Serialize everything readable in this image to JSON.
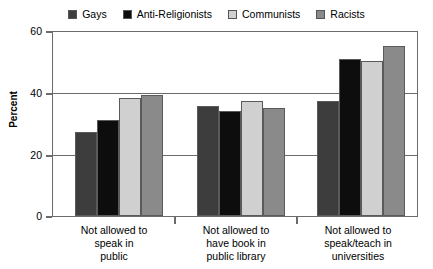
{
  "chart_data": {
    "type": "bar",
    "title": "",
    "subtitle": "",
    "xlabel": "",
    "ylabel": "Percent",
    "ylim": [
      0,
      60
    ],
    "yticks": [
      0,
      20,
      40,
      60
    ],
    "grid": true,
    "legend_position": "top-center",
    "categories": [
      "Not allowed to speak in public",
      "Not allowed to have book in public library",
      "Not allowed to speak/teach in universities"
    ],
    "category_lines": [
      [
        "Not allowed to",
        "speak in",
        "public"
      ],
      [
        "Not allowed to",
        "have book in",
        "public library"
      ],
      [
        "Not allowed to",
        "speak/teach in",
        "universities"
      ]
    ],
    "series": [
      {
        "name": "Gays",
        "color": "#3d3d3d",
        "values": [
          27,
          35.5,
          37
        ]
      },
      {
        "name": "Anti-Religionists",
        "color": "#0d0d0d",
        "values": [
          31,
          34,
          50.5
        ]
      },
      {
        "name": "Communists",
        "color": "#d0d0d0",
        "values": [
          38,
          37,
          50
        ]
      },
      {
        "name": "Racists",
        "color": "#8a8a8a",
        "values": [
          39,
          35,
          55
        ]
      }
    ]
  },
  "axis": {
    "y_tick_labels": [
      "60",
      "40",
      "20",
      "0"
    ],
    "y_title": "Percent"
  },
  "legend": {
    "items": [
      {
        "label": "Gays",
        "color": "#3d3d3d"
      },
      {
        "label": "Anti-Religionists",
        "color": "#0d0d0d"
      },
      {
        "label": "Communists",
        "color": "#d0d0d0"
      },
      {
        "label": "Racists",
        "color": "#8a8a8a"
      }
    ]
  },
  "colors": {
    "frame": "#6b6b6b",
    "gridline": "#6b6b6b",
    "bar_border": "#5a5a5a",
    "background": "#ffffff",
    "text": "#000000"
  }
}
